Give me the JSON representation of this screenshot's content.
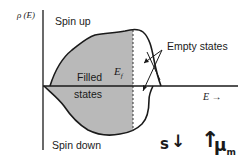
{
  "diagram": {
    "y_axis_label": "ρ (E)",
    "x_axis_label": "E →",
    "labels": {
      "spin_up": "Spin up",
      "spin_down": "Spin down",
      "filled_line1": "Filled",
      "filled_line2": "states",
      "fermi_level": "E",
      "fermi_sub": "f",
      "empty_states": "Empty states"
    },
    "annotation": {
      "spin": "s",
      "spin_arrow": "↓",
      "moment_arrow": "↑",
      "moment": "μ",
      "moment_sub": "m"
    },
    "colors": {
      "filled": "#b9b9b9",
      "line": "#1a1a1a",
      "background": "#ffffff"
    }
  }
}
